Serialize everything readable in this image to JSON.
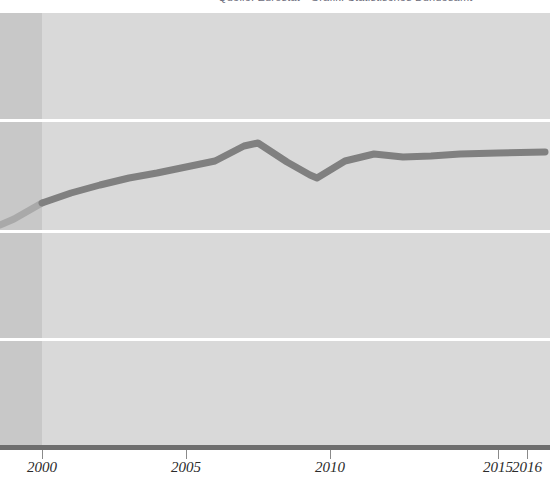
{
  "title": {
    "text": "Quelle: Eurostat  ·  Grafik: Statistisches Bundesamt",
    "clipped": true
  },
  "axis": {
    "ticks": [
      {
        "label": "2000",
        "x": 42
      },
      {
        "label": "2005",
        "x": 186
      },
      {
        "label": "2010",
        "x": 330
      },
      {
        "label": "2015",
        "x": 498
      },
      {
        "label": "2016",
        "x": 527
      }
    ]
  },
  "gridlines": {
    "y": [
      106,
      217,
      325
    ],
    "color": "#ffffff",
    "count": 3
  },
  "colors": {
    "plot_background": "#d9d9d9",
    "shaded_band": "#c8c8c8",
    "gridline": "#ffffff",
    "series_line": "#808080",
    "series_line_faded": "#a9a9a9",
    "axis_line": "#6e6e6e",
    "tick_label": "#2b2b2b",
    "title_text": "#6b6b7a",
    "page_background": "#ffffff"
  },
  "chart_data": {
    "type": "line",
    "title": "Quelle: Eurostat  ·  Grafik: Statistisches Bundesamt",
    "xlabel": "",
    "ylabel": "",
    "xlim": [
      1998.5,
      2016.5
    ],
    "ylim": [
      0,
      100
    ],
    "grid": true,
    "legend": "none",
    "x_tick_labels": [
      "2000",
      "2005",
      "2010",
      "2015",
      "2016"
    ],
    "x_tick_values": [
      2000,
      2005,
      2010,
      2015,
      2016
    ],
    "y_tick_labels": [],
    "annotations": [
      "Leading segment before year 2000 drawn over a darker shaded band and in a lighter line tone (estimated / pre-series data)."
    ],
    "series": [
      {
        "name": "indicator",
        "x": [
          1998.5,
          1999,
          2000,
          2001,
          2002,
          2003,
          2004,
          2005,
          2006,
          2007,
          2007.5,
          2008,
          2009,
          2009.5,
          2010,
          2011,
          2012,
          2013,
          2014,
          2015,
          2016
        ],
        "values": [
          53.0,
          54.2,
          58.5,
          61.3,
          63.5,
          65.5,
          67.0,
          68.7,
          70.4,
          72.0,
          72.6,
          70.0,
          66.5,
          65.5,
          68.0,
          69.6,
          69.0,
          69.2,
          69.6,
          70.0,
          70.6
        ],
        "pixel_points": [
          [
            0,
            225
          ],
          [
            14,
            219
          ],
          [
            42,
            203
          ],
          [
            71,
            193
          ],
          [
            100,
            185
          ],
          [
            129,
            178
          ],
          [
            157,
            173
          ],
          [
            186,
            167
          ],
          [
            215,
            161
          ],
          [
            244,
            146
          ],
          [
            258,
            143
          ],
          [
            287,
            162
          ],
          [
            310,
            175
          ],
          [
            317,
            178
          ],
          [
            345,
            161
          ],
          [
            374,
            154
          ],
          [
            403,
            157
          ],
          [
            431,
            156
          ],
          [
            460,
            154
          ],
          [
            498,
            153
          ],
          [
            545,
            152
          ]
        ]
      }
    ]
  }
}
